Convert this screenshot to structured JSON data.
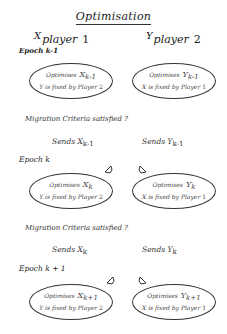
{
  "title": "Optimisation",
  "players": [
    {
      "symbol": "X",
      "label": "player",
      "number": "1"
    },
    {
      "symbol": "Y",
      "label": "player",
      "number": "2"
    }
  ],
  "epochs": [
    {
      "label": "Epoch k-1",
      "left": {
        "optimises": "Optimises",
        "var": "X",
        "sub": "k-1",
        "fixed": "Y is fixed by Player",
        "fixed_num": "2"
      },
      "right": {
        "optimises": "Optimises",
        "var": "Y",
        "sub": "k-1",
        "fixed": "X is fixed by Player",
        "fixed_num": "1"
      }
    },
    {
      "label": "Epoch k",
      "left": {
        "optimises": "Optimises",
        "var": "X",
        "sub": "k",
        "fixed": "Y is fixed by Player",
        "fixed_num": "2"
      },
      "right": {
        "optimises": "Optimises",
        "var": "Y",
        "sub": "k",
        "fixed": "X is fixed by Player",
        "fixed_num": "1"
      }
    },
    {
      "label": "Epoch k + 1",
      "left": {
        "optimises": "Optimises",
        "var": "X",
        "sub": "k+1",
        "fixed": "Y is fixed by Player",
        "fixed_num": "2"
      },
      "right": {
        "optimises": "Optimises",
        "var": "Y",
        "sub": "k+1",
        "fixed": "X is fixed by Player",
        "fixed_num": "1"
      }
    }
  ],
  "migrations": [
    {
      "question": "Migration Criteria satisfied ?",
      "left": {
        "sends": "Sends",
        "var": "X",
        "sub": "k-1"
      },
      "right": {
        "sends": "Sends",
        "var": "Y",
        "sub": "k-1"
      }
    },
    {
      "question": "Migration Criteria satisfied ?",
      "left": {
        "sends": "Sends",
        "var": "X",
        "sub": "k"
      },
      "right": {
        "sends": "Sends",
        "var": "Y",
        "sub": "k"
      }
    }
  ]
}
